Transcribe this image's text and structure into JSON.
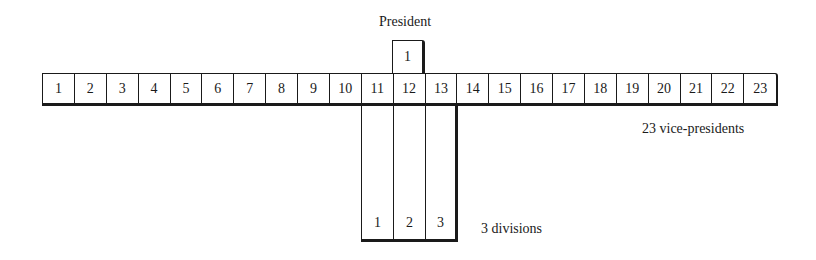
{
  "president": {
    "label": "President",
    "number": "1"
  },
  "vice_presidents": {
    "label": "23 vice-presidents",
    "cells": [
      "1",
      "2",
      "3",
      "4",
      "5",
      "6",
      "7",
      "8",
      "9",
      "10",
      "11",
      "12",
      "13",
      "14",
      "15",
      "16",
      "17",
      "18",
      "19",
      "20",
      "21",
      "22",
      "23"
    ]
  },
  "divisions": {
    "label": "3 divisions",
    "cells": [
      "1",
      "2",
      "3"
    ]
  }
}
